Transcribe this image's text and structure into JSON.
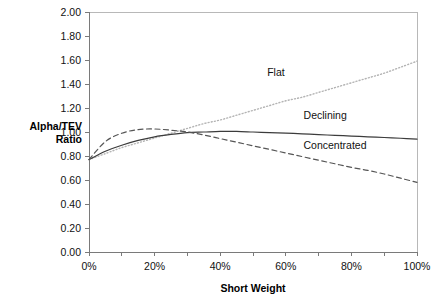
{
  "chart_data": {
    "type": "line",
    "title": "",
    "xlabel": "Short Weight",
    "ylabel": "Alpha/TEV Ratio",
    "ylabel_line1": "Alpha/TEV",
    "ylabel_line2": "Ratio",
    "xlim": [
      0,
      100
    ],
    "ylim": [
      0,
      2.0
    ],
    "x_tick_step": 10,
    "x_label_step": 20,
    "y_tick_step": 0.2,
    "grid": false,
    "legend_position": "inline-annotations",
    "x_tick_labels": [
      "0%",
      "20%",
      "40%",
      "60%",
      "80%",
      "100%"
    ],
    "x_tick_values": [
      0,
      20,
      40,
      60,
      80,
      100
    ],
    "y_tick_labels": [
      "0.00",
      "0.20",
      "0.40",
      "0.60",
      "0.80",
      "1.00",
      "1.20",
      "1.40",
      "1.60",
      "1.80",
      "2.00"
    ],
    "y_tick_values": [
      0,
      0.2,
      0.4,
      0.6,
      0.8,
      1.0,
      1.2,
      1.4,
      1.6,
      1.8,
      2.0
    ],
    "x": [
      0,
      5,
      10,
      15,
      20,
      25,
      30,
      35,
      40,
      45,
      50,
      55,
      60,
      65,
      70,
      75,
      80,
      85,
      90,
      95,
      100
    ],
    "series": [
      {
        "name": "Flat",
        "style": "dotted",
        "color": "#b4b4b4",
        "label_x": 57,
        "label_y": 1.47,
        "values": [
          0.77,
          0.82,
          0.87,
          0.91,
          0.95,
          0.99,
          1.03,
          1.07,
          1.1,
          1.14,
          1.18,
          1.22,
          1.26,
          1.29,
          1.33,
          1.37,
          1.41,
          1.45,
          1.49,
          1.54,
          1.59
        ]
      },
      {
        "name": "Declining",
        "style": "solid",
        "color": "#3c3c3c",
        "label_x": 72,
        "label_y": 1.11,
        "values": [
          0.77,
          0.84,
          0.89,
          0.93,
          0.96,
          0.98,
          0.995,
          1.0,
          1.005,
          1.005,
          1.0,
          0.995,
          0.99,
          0.985,
          0.978,
          0.972,
          0.966,
          0.96,
          0.954,
          0.948,
          0.94
        ]
      },
      {
        "name": "Concentrated",
        "style": "dashed",
        "color": "#555555",
        "label_x": 75,
        "label_y": 0.86,
        "values": [
          0.77,
          0.92,
          0.99,
          1.02,
          1.025,
          1.015,
          1.0,
          0.975,
          0.945,
          0.915,
          0.885,
          0.855,
          0.825,
          0.795,
          0.765,
          0.735,
          0.705,
          0.68,
          0.65,
          0.615,
          0.58
        ]
      }
    ]
  }
}
